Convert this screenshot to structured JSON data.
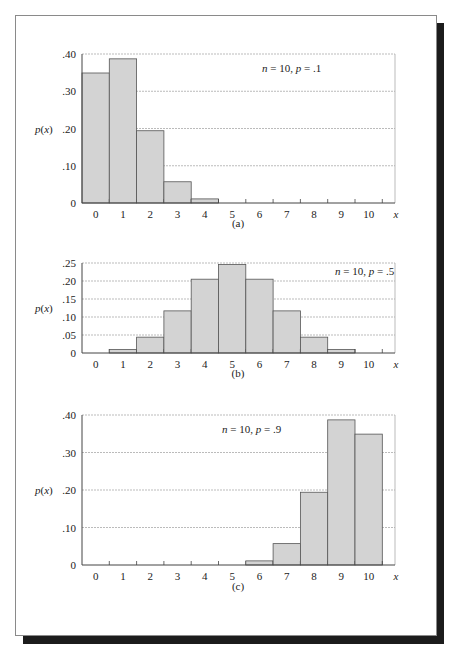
{
  "chart_data": [
    {
      "type": "bar",
      "title": "",
      "annotation": {
        "n": "10",
        "p": ".1"
      },
      "caption": "(a)",
      "xlabel": "x",
      "ylabel": "p(x)",
      "categories": [
        "0",
        "1",
        "2",
        "3",
        "4",
        "5",
        "6",
        "7",
        "8",
        "9",
        "10"
      ],
      "values": [
        0.349,
        0.387,
        0.194,
        0.057,
        0.011,
        0.001,
        0.0,
        0.0,
        0.0,
        0.0,
        0.0
      ],
      "yticks": [
        0,
        0.1,
        0.2,
        0.3,
        0.4
      ],
      "ytick_labels": [
        "0",
        ".10",
        ".20",
        ".30",
        ".40"
      ],
      "ylim": [
        0,
        0.4
      ],
      "grid": true
    },
    {
      "type": "bar",
      "title": "",
      "annotation": {
        "n": "10",
        "p": ".5"
      },
      "caption": "(b)",
      "xlabel": "x",
      "ylabel": "p(x)",
      "categories": [
        "0",
        "1",
        "2",
        "3",
        "4",
        "5",
        "6",
        "7",
        "8",
        "9",
        "10"
      ],
      "values": [
        0.001,
        0.01,
        0.044,
        0.117,
        0.205,
        0.246,
        0.205,
        0.117,
        0.044,
        0.01,
        0.001
      ],
      "yticks": [
        0,
        0.05,
        0.1,
        0.15,
        0.2,
        0.25
      ],
      "ytick_labels": [
        "0",
        ".05",
        ".10",
        ".15",
        ".20",
        ".25"
      ],
      "ylim": [
        0,
        0.25
      ],
      "grid": true
    },
    {
      "type": "bar",
      "title": "",
      "annotation": {
        "n": "10",
        "p": ".9"
      },
      "caption": "(c)",
      "xlabel": "x",
      "ylabel": "p(x)",
      "categories": [
        "0",
        "1",
        "2",
        "3",
        "4",
        "5",
        "6",
        "7",
        "8",
        "9",
        "10"
      ],
      "values": [
        0.0,
        0.0,
        0.0,
        0.0,
        0.0,
        0.001,
        0.011,
        0.057,
        0.194,
        0.387,
        0.349
      ],
      "yticks": [
        0,
        0.1,
        0.2,
        0.3,
        0.4
      ],
      "ytick_labels": [
        "0",
        ".10",
        ".20",
        ".30",
        ".40"
      ],
      "ylim": [
        0,
        0.4
      ],
      "grid": true
    }
  ],
  "colors": {
    "bar_fill": "#d3d3d3",
    "bar_stroke": "#555555",
    "grid": "#aaaaaa",
    "axis": "#444444"
  }
}
